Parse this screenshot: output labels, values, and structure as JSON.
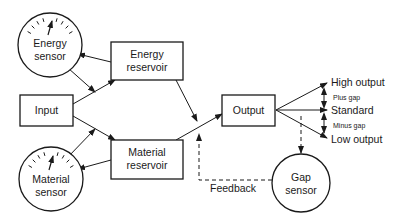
{
  "diagram": {
    "type": "flow-control-diagram",
    "colors": {
      "stroke": "#1a1a1a",
      "background": "#ffffff"
    },
    "nodes": {
      "energy_sensor": {
        "line1": "Energy",
        "line2": "sensor",
        "shape": "gauge-circle"
      },
      "energy_reservoir": {
        "line1": "Energy",
        "line2": "reservoir",
        "shape": "box"
      },
      "input": {
        "label": "Input",
        "shape": "box"
      },
      "material_reservoir": {
        "line1": "Material",
        "line2": "reservoir",
        "shape": "box"
      },
      "material_sensor": {
        "line1": "Material",
        "line2": "sensor",
        "shape": "gauge-circle"
      },
      "output": {
        "label": "Output",
        "shape": "box"
      },
      "gap_sensor": {
        "line1": "Gap",
        "line2": "sensor",
        "shape": "circle"
      }
    },
    "output_levels": {
      "high": "High output",
      "plus_gap": "Plus gap",
      "standard": "Standard",
      "minus_gap": "Minus gap",
      "low": "Low output"
    },
    "feedback_label": "Feedback",
    "edges": [
      {
        "from": "Input",
        "to": "Energy reservoir",
        "style": "solid"
      },
      {
        "from": "Input",
        "to": "Material reservoir",
        "style": "solid"
      },
      {
        "from": "Energy reservoir",
        "to": "Energy sensor",
        "style": "solid"
      },
      {
        "from": "Energy sensor",
        "to": "Input→Energy reservoir line",
        "style": "solid"
      },
      {
        "from": "Material reservoir",
        "to": "Material sensor",
        "style": "solid"
      },
      {
        "from": "Material sensor",
        "to": "Input→Material reservoir line",
        "style": "solid"
      },
      {
        "from": "Energy reservoir",
        "to": "Material reservoir→Output line",
        "style": "solid"
      },
      {
        "from": "Material reservoir",
        "to": "Output",
        "style": "solid"
      },
      {
        "from": "Output",
        "to": "High output",
        "style": "solid"
      },
      {
        "from": "Output",
        "to": "Standard",
        "style": "solid"
      },
      {
        "from": "Output",
        "to": "Low output",
        "style": "solid"
      },
      {
        "from": "Output",
        "to": "Gap sensor",
        "style": "dashed"
      },
      {
        "from": "Gap sensor",
        "to": "Material reservoir→Output line",
        "style": "dashed",
        "label": "Feedback"
      }
    ]
  }
}
